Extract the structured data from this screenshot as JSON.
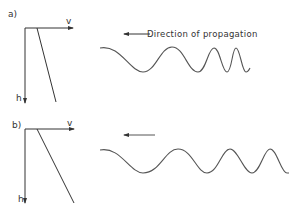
{
  "panels": [
    {
      "label": "a)",
      "axis_x_label": "v",
      "axis_y_label": "h",
      "caption": "Direction of propagation",
      "description": "Velocity increasing steeply with depth; wavelength shortens strongly toward the right"
    },
    {
      "label": "b)",
      "axis_x_label": "v",
      "axis_y_label": "h",
      "caption": "",
      "description": "Velocity increasing gently with depth; wavelength shortens gradually toward the right"
    }
  ],
  "colors": {
    "line": "#333333",
    "wave": "#555555",
    "background": "#ffffff"
  }
}
